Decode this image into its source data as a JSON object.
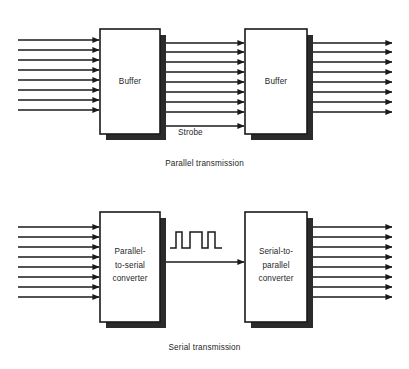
{
  "figure": {
    "background_color": "#ffffff",
    "line_color": "#1a1a1a",
    "shadow_color": "#2b2b2b"
  },
  "panels": [
    {
      "id": "parallel",
      "caption": "Parallel transmission",
      "left_box_label": "Buffer",
      "right_box_label": "Buffer",
      "input_bus_lines": 8,
      "middle_bus_lines": 8,
      "output_bus_lines": 8,
      "extra_signal_label": "Strobe"
    },
    {
      "id": "serial",
      "caption": "Serial transmission",
      "left_box_label_lines": [
        "Parallel-",
        "to-serial",
        "converter"
      ],
      "right_box_label_lines": [
        "Serial-to-",
        "parallel",
        "converter"
      ],
      "input_bus_lines": 8,
      "middle_bus_lines": 1,
      "output_bus_lines": 8,
      "waveform_pulses": 3
    }
  ],
  "labels": {
    "buffer": "Buffer",
    "parallel_to_serial": "Parallel-\nto-serial\nconverter",
    "serial_to_parallel": "Serial-to-\nparallel\nconverter",
    "strobe": "Strobe",
    "parallel_transmission": "Parallel transmission",
    "serial_transmission": "Serial transmission"
  }
}
